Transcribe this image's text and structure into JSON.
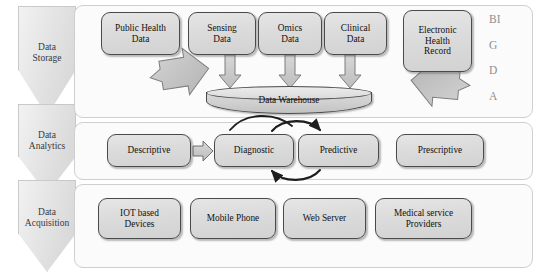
{
  "diagram": {
    "colors": {
      "node_fill": "#dcdcdc",
      "node_border": "#4a4a4a",
      "panel_fill": "#fbfbfb",
      "panel_border": "#cfcfcf",
      "chevron_fill": "#e4e4e4",
      "arrow_fill": "#c6c6c6",
      "bigdata_text": "#8e8e8e"
    }
  },
  "tiers": [
    {
      "label_line1": "Data",
      "label_line2": "Storage"
    },
    {
      "label_line1": "Data",
      "label_line2": "Analytics"
    },
    {
      "label_line1": "Data",
      "label_line2": "Acquisition"
    }
  ],
  "storage": {
    "sources": [
      {
        "line1": "Public Health",
        "line2": "Data",
        "line3": ""
      },
      {
        "line1": "Sensing",
        "line2": "Data",
        "line3": ""
      },
      {
        "line1": "Omics",
        "line2": "Data",
        "line3": ""
      },
      {
        "line1": "Clinical",
        "line2": "Data",
        "line3": ""
      },
      {
        "line1": "Electronic",
        "line2": "Health",
        "line3": "Record"
      }
    ],
    "warehouse_label": "Data Warehouse",
    "big_data_letters": [
      "BI",
      "G",
      "D",
      "A"
    ]
  },
  "analytics": {
    "stages": [
      {
        "label": "Descriptive"
      },
      {
        "label": "Diagnostic"
      },
      {
        "label": "Predictive"
      },
      {
        "label": "Prescriptive"
      }
    ]
  },
  "acquisition": {
    "sources": [
      {
        "line1": "IOT based",
        "line2": "Devices"
      },
      {
        "line1": "Mobile Phone",
        "line2": ""
      },
      {
        "line1": "Web Server",
        "line2": ""
      },
      {
        "line1": "Medical service",
        "line2": "Providers"
      }
    ]
  }
}
